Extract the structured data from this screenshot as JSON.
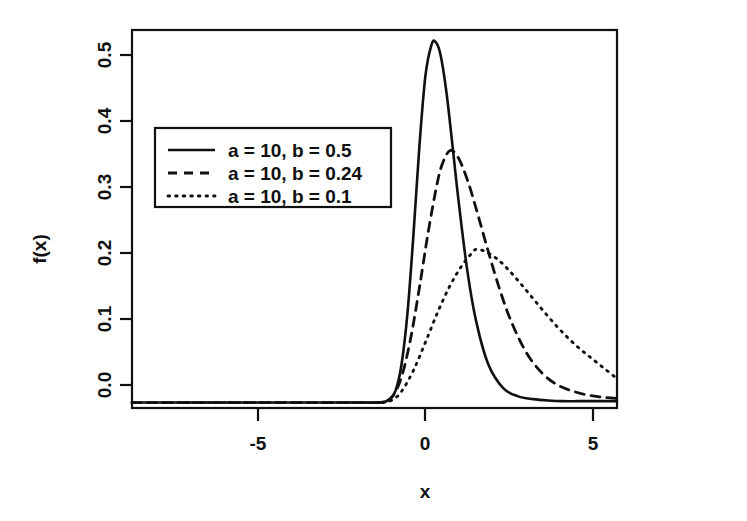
{
  "chart_data": {
    "type": "line",
    "title": "",
    "subtitle": "",
    "xlabel": "x",
    "ylabel": "f(x)",
    "xlim": [
      -8.4,
      7.8
    ],
    "ylim": [
      -0.008,
      0.545
    ],
    "grid": false,
    "legend_position": "upper-left",
    "xticks": [
      -5,
      0,
      5
    ],
    "xtick_labels": [
      "-5",
      "0",
      "5"
    ],
    "yticks": [
      0.0,
      0.1,
      0.2,
      0.3,
      0.4,
      0.5
    ],
    "ytick_labels": [
      "0.0",
      "0.1",
      "0.2",
      "0.3",
      "0.4",
      "0.5"
    ],
    "series": [
      {
        "name": "a = 10, b = 0.5",
        "style": "solid",
        "color": "#101010",
        "peak_x": 1.73,
        "peak_y": 0.528,
        "x": [
          -8.4,
          -6.0,
          -4.0,
          -2.0,
          -1.0,
          -0.2,
          0.0,
          0.2,
          0.4,
          0.6,
          0.8,
          1.0,
          1.2,
          1.4,
          1.6,
          1.73,
          1.9,
          2.1,
          2.3,
          2.5,
          2.8,
          3.1,
          3.5,
          4.0,
          4.5,
          5.0,
          5.5,
          6.0,
          6.5,
          7.0,
          7.8
        ],
        "y": [
          0.0,
          0.0,
          0.0,
          0.0,
          0.0,
          0.0,
          0.001,
          0.004,
          0.017,
          0.055,
          0.13,
          0.245,
          0.375,
          0.478,
          0.523,
          0.528,
          0.51,
          0.455,
          0.378,
          0.298,
          0.193,
          0.118,
          0.056,
          0.021,
          0.009,
          0.005,
          0.003,
          0.002,
          0.002,
          0.002,
          0.002
        ]
      },
      {
        "name": "a = 10, b = 0.24",
        "style": "dashed",
        "color": "#101010",
        "peak_x": 2.24,
        "peak_y": 0.369,
        "x": [
          -8.4,
          -6.0,
          -4.0,
          -2.0,
          -1.0,
          -0.2,
          0.0,
          0.3,
          0.6,
          0.9,
          1.2,
          1.5,
          1.8,
          2.0,
          2.24,
          2.5,
          2.8,
          3.1,
          3.5,
          3.9,
          4.3,
          4.8,
          5.3,
          5.8,
          6.3,
          6.8,
          7.3,
          7.8
        ],
        "y": [
          0.0,
          0.0,
          0.0,
          0.0,
          0.0,
          0.0,
          0.001,
          0.009,
          0.037,
          0.092,
          0.168,
          0.251,
          0.322,
          0.353,
          0.369,
          0.358,
          0.326,
          0.283,
          0.221,
          0.163,
          0.115,
          0.071,
          0.043,
          0.026,
          0.017,
          0.011,
          0.008,
          0.006
        ]
      },
      {
        "name": "a = 10, b = 0.1",
        "style": "dotted",
        "color": "#101010",
        "peak_x": 3.13,
        "peak_y": 0.224,
        "x": [
          -8.4,
          -6.0,
          -4.0,
          -2.0,
          -1.0,
          -0.2,
          0.0,
          0.3,
          0.6,
          1.0,
          1.4,
          1.8,
          2.2,
          2.6,
          3.0,
          3.13,
          3.4,
          3.8,
          4.2,
          4.6,
          5.0,
          5.4,
          5.8,
          6.2,
          6.6,
          7.0,
          7.4,
          7.8
        ],
        "y": [
          0.0,
          0.0,
          0.0,
          0.0,
          0.0,
          0.0,
          0.0,
          0.004,
          0.016,
          0.047,
          0.088,
          0.131,
          0.169,
          0.199,
          0.221,
          0.224,
          0.221,
          0.21,
          0.193,
          0.173,
          0.152,
          0.131,
          0.111,
          0.093,
          0.077,
          0.063,
          0.049,
          0.035
        ]
      }
    ]
  },
  "legend": {
    "entries": [
      {
        "label": "a = 10, b = 0.5"
      },
      {
        "label": "a = 10, b = 0.24"
      },
      {
        "label": "a = 10, b = 0.1"
      }
    ]
  },
  "axes": {
    "x_title": "x",
    "y_title": "f(x)",
    "x_tick_labels": [
      "-5",
      "0",
      "5"
    ],
    "y_tick_labels": [
      "0.0",
      "0.1",
      "0.2",
      "0.3",
      "0.4",
      "0.5"
    ]
  },
  "colors": {
    "ink": "#101010",
    "background": "#ffffff"
  }
}
